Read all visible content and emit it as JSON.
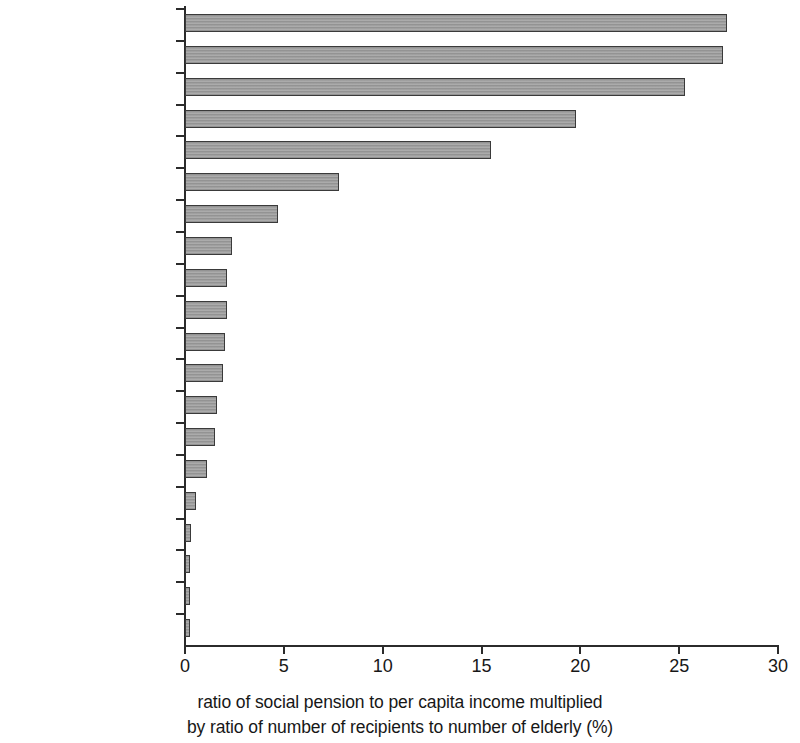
{
  "chart_data": {
    "type": "bar",
    "orientation": "horizontal",
    "title": "",
    "subtitle": "",
    "xlabel": "ratio of social pension to per capita income multiplied by ratio of number of recipients to number of elderly (%)",
    "xlabel_lines": [
      "ratio of social pension to per capita income multiplied",
      "by ratio of number of recipients to number of elderly (%)"
    ],
    "ylabel": "",
    "xlim": [
      0,
      30
    ],
    "xticks": [
      0,
      5,
      10,
      15,
      20,
      25,
      30
    ],
    "xtick_labels": [
      "0",
      "5",
      "10",
      "15",
      "20",
      "25",
      "30"
    ],
    "grid": false,
    "legend": null,
    "bar_color": "#9b9b9b",
    "bar_edge_color": "#3a3a3a",
    "axis_color": "#2b2b2b",
    "categories": [
      "South Africa",
      "Mauritius",
      "Bolivia",
      "Namibia",
      "Brazil",
      "Botswana",
      "Nepal",
      "Egypt, Arab Rep.",
      "Turkey",
      "Costa Rica",
      "Colombia",
      "Chile",
      "Bangladesh",
      "India",
      "Uruguay",
      "Russian Federation",
      "Argentina",
      "Estonia",
      "Algeria",
      "Dominican Republic"
    ],
    "values": [
      27.4,
      27.2,
      25.3,
      19.8,
      15.5,
      7.8,
      4.7,
      2.4,
      2.1,
      2.1,
      2.0,
      1.9,
      1.6,
      1.5,
      1.1,
      0.55,
      0.28,
      0.22,
      0.22,
      0.2
    ]
  }
}
